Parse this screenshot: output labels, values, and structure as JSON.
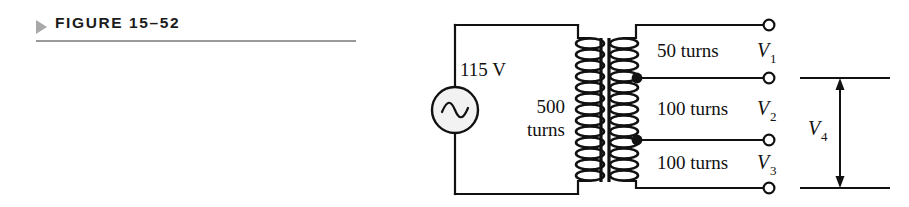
{
  "figure": {
    "marker_icon": "triangle-right-icon",
    "label": "FIGURE 15–52",
    "rule_color": "#9a9a9a",
    "marker_color": "#a9a9a9"
  },
  "circuit": {
    "type": "transformer-schematic",
    "source": {
      "icon": "ac-source-icon",
      "voltage_label": "115 V"
    },
    "primary": {
      "turns_line1": "500",
      "turns_line2": "turns",
      "turns_full": "500 turns",
      "coil_loops": 14
    },
    "core": {
      "icon": "iron-core-icon",
      "bars": 2
    },
    "secondary": {
      "coil_loops": 13,
      "taps": [
        {
          "name": "tap-dot-1",
          "type": "filled-dot"
        },
        {
          "name": "tap-dot-2",
          "type": "filled-dot"
        }
      ],
      "windings": [
        {
          "turns_label": "50 turns",
          "voltage_var": "V",
          "voltage_sub": "1"
        },
        {
          "turns_label": "100 turns",
          "voltage_var": "V",
          "voltage_sub": "2"
        },
        {
          "turns_label": "100 turns",
          "voltage_var": "V",
          "voltage_sub": "3"
        }
      ],
      "terminals": [
        {
          "name": "terminal-v1-top"
        },
        {
          "name": "terminal-v1-v2"
        },
        {
          "name": "terminal-v2-v3"
        },
        {
          "name": "terminal-v3-bottom"
        }
      ]
    },
    "measurement": {
      "name": "v4-span",
      "voltage_var": "V",
      "voltage_sub": "4",
      "arrow": "double-headed-vertical-arrow"
    },
    "line_color": "#111111"
  }
}
